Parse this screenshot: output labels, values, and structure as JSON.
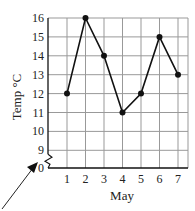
{
  "chart_data": {
    "type": "line",
    "title": "",
    "xlabel": "May",
    "ylabel": "Temp °C",
    "categories": [
      "1",
      "2",
      "3",
      "4",
      "5",
      "6",
      "7"
    ],
    "x": [
      1,
      2,
      3,
      4,
      5,
      6,
      7
    ],
    "values": [
      12,
      16,
      14,
      11,
      12,
      15,
      13
    ],
    "series": [
      {
        "name": "Temperature",
        "values": [
          12,
          16,
          14,
          11,
          12,
          15,
          13
        ]
      }
    ],
    "y_ticks": [
      "0",
      "9",
      "10",
      "11",
      "12",
      "13",
      "14",
      "15",
      "16"
    ],
    "x_ticks": [
      "1",
      "2",
      "3",
      "4",
      "5",
      "6",
      "7"
    ],
    "ylim": [
      9,
      16
    ],
    "axis_break": true,
    "grid": true,
    "legend": "none",
    "annotations": [
      "arrow pointing to y-axis break"
    ]
  }
}
